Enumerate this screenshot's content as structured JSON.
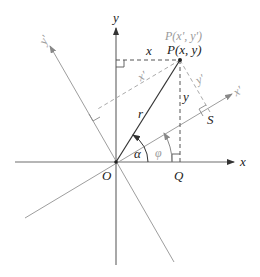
{
  "diagram": {
    "colors": {
      "axis": "#6e6e6e",
      "rotated_axis": "#9e9e9e",
      "vector": "#333333",
      "dashed_dark": "#555555",
      "dashed_grey": "#aaaaaa",
      "label_dark": "#222222",
      "label_grey": "#9a9a9a"
    },
    "labels": {
      "y_axis": "y",
      "x_axis": "x",
      "x_prime_axis": "x'",
      "y_prime_axis": "y'",
      "origin": "O",
      "point_q": "Q",
      "point_s": "S",
      "point_p_prime": "P(x', y')",
      "point_p": "P(x, y)",
      "seg_x": "x",
      "seg_y": "y",
      "seg_x_prime": "x'",
      "seg_y_prime": "y'",
      "radius": "r",
      "angle_alpha": "α",
      "angle_phi": "φ"
    }
  }
}
